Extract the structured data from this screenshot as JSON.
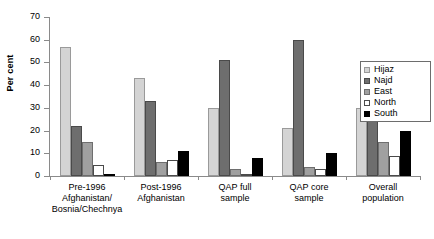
{
  "chart_data": {
    "type": "bar",
    "title": "",
    "xlabel": "",
    "ylabel": "Per cent",
    "ylim": [
      0,
      70
    ],
    "yticks": [
      0,
      10,
      20,
      30,
      40,
      50,
      60,
      70
    ],
    "grid": false,
    "legend_position": "right",
    "categories": [
      "Pre-1996 Afghanistan/ Bosnia/Chechnya",
      "Post-1996 Afghanistan",
      "QAP full sample",
      "QAP core sample",
      "Overall population"
    ],
    "category_lines": [
      [
        "Pre-1996",
        "Afghanistan/",
        "Bosnia/Chechnya"
      ],
      [
        "Post-1996",
        "Afghanistan"
      ],
      [
        "QAP full",
        "sample"
      ],
      [
        "QAP core",
        "sample"
      ],
      [
        "Overall",
        "population"
      ]
    ],
    "series": [
      {
        "name": "Hijaz",
        "color": "#d4d4d4",
        "values": [
          57,
          43,
          30,
          21,
          30
        ]
      },
      {
        "name": "Najd",
        "color": "#6e6e6e",
        "values": [
          22,
          33,
          51,
          60,
          25
        ]
      },
      {
        "name": "East",
        "color": "#a0a0a0",
        "values": [
          15,
          6,
          3,
          4,
          15
        ]
      },
      {
        "name": "North",
        "color": "#ffffff",
        "values": [
          5,
          7,
          0,
          3,
          9
        ]
      },
      {
        "name": "South",
        "color": "#000000",
        "values": [
          1,
          11,
          8,
          10,
          20
        ]
      }
    ]
  },
  "legend": {
    "items": [
      {
        "label": "Hijaz"
      },
      {
        "label": "Najd"
      },
      {
        "label": "East"
      },
      {
        "label": "North"
      },
      {
        "label": "South"
      }
    ]
  }
}
